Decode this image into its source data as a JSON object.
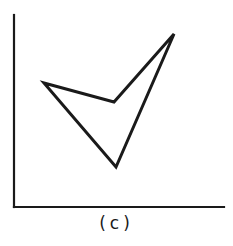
{
  "figure": {
    "caption": "(c)",
    "stroke_color": "#1a1a1a",
    "background": "#ffffff"
  },
  "diagram": {
    "axes": {
      "y_axis": {
        "x": 14,
        "y_top": 15,
        "y_bottom": 207
      },
      "x_axis": {
        "y": 207,
        "x_left": 14,
        "x_right": 224
      }
    },
    "polygon": {
      "closed": true,
      "vertices": [
        {
          "name": "left",
          "x": 44,
          "y": 83
        },
        {
          "name": "inner",
          "x": 114,
          "y": 102
        },
        {
          "name": "top-right",
          "x": 174,
          "y": 34
        },
        {
          "name": "bottom",
          "x": 116,
          "y": 167
        }
      ]
    }
  }
}
